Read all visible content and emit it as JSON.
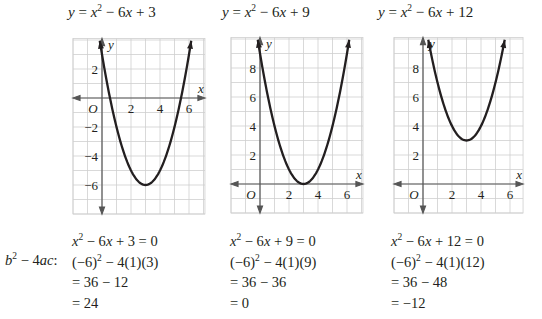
{
  "titles": [
    {
      "lhs": "y",
      "rhs_a": "x",
      "exp": "2",
      "rhs_b": " − 6",
      "var": "x",
      "rhs_c": " + 3"
    },
    {
      "lhs": "y",
      "rhs_a": "x",
      "exp": "2",
      "rhs_b": " − 6",
      "var": "x",
      "rhs_c": " + 9"
    },
    {
      "lhs": "y",
      "rhs_a": "x",
      "exp": "2",
      "rhs_b": " − 6",
      "var": "x",
      "rhs_c": " + 12"
    }
  ],
  "discriminant_label": {
    "b": "b",
    "exp": "2",
    "rest": " − 4",
    "ac": "ac",
    "colon": ":"
  },
  "calculations": [
    {
      "equation": {
        "x": "x",
        "exp": "2",
        "mid": " − 6",
        "x2": "x",
        "end": " + 3 = 0"
      },
      "substitution": {
        "base": "(−6)",
        "exp": "2",
        "end": " − 4(1)(3)"
      },
      "step": "= 36 − 12",
      "result": "= 24"
    },
    {
      "equation": {
        "x": "x",
        "exp": "2",
        "mid": " − 6",
        "x2": "x",
        "end": " + 9 = 0"
      },
      "substitution": {
        "base": "(−6)",
        "exp": "2",
        "end": " − 4(1)(9)"
      },
      "step": "= 36 − 36",
      "result": "= 0"
    },
    {
      "equation": {
        "x": "x",
        "exp": "2",
        "mid": " − 6",
        "x2": "x",
        "end": " + 12 = 0"
      },
      "substitution": {
        "base": "(−6)",
        "exp": "2",
        "end": " − 4(1)(12)"
      },
      "step": "= 36 − 48",
      "result": "= −12"
    }
  ],
  "axis_labels": {
    "x": "x",
    "y": "y",
    "origin": "O"
  },
  "colors": {
    "grid": "#cfcfcf",
    "axis": "#555555",
    "curve": "#231f20",
    "text": "#231f20"
  },
  "chart_data": [
    {
      "type": "line",
      "title": "y = x^2 − 6x + 3",
      "function": {
        "a": 1,
        "b": -6,
        "c": 3
      },
      "xlabel": "x",
      "ylabel": "y",
      "xlim": [
        -2,
        7.1
      ],
      "ylim": [
        -8,
        4.1
      ],
      "x_ticks": [
        2,
        4,
        6
      ],
      "y_ticks": [
        2,
        -2,
        -4,
        -6
      ],
      "grid": true,
      "grid_step": 1,
      "vertex": [
        3,
        -6
      ],
      "x_intercepts": [
        0.55,
        5.45
      ],
      "points": [
        [
          0,
          3
        ],
        [
          1,
          -2
        ],
        [
          2,
          -5
        ],
        [
          3,
          -6
        ],
        [
          4,
          -5
        ],
        [
          5,
          -2
        ],
        [
          6,
          3
        ]
      ]
    },
    {
      "type": "line",
      "title": "y = x^2 − 6x + 9",
      "function": {
        "a": 1,
        "b": -6,
        "c": 9
      },
      "xlabel": "x",
      "ylabel": "y",
      "xlim": [
        -2,
        7.1
      ],
      "ylim": [
        -2,
        10.1
      ],
      "x_ticks": [
        2,
        4,
        6
      ],
      "y_ticks": [
        2,
        4,
        6,
        8
      ],
      "grid": true,
      "grid_step": 1,
      "vertex": [
        3,
        0
      ],
      "x_intercepts": [
        3
      ],
      "points": [
        [
          0,
          9
        ],
        [
          1,
          4
        ],
        [
          2,
          1
        ],
        [
          3,
          0
        ],
        [
          4,
          1
        ],
        [
          5,
          4
        ],
        [
          6,
          9
        ]
      ]
    },
    {
      "type": "line",
      "title": "y = x^2 − 6x + 12",
      "function": {
        "a": 1,
        "b": -6,
        "c": 12
      },
      "xlabel": "x",
      "ylabel": "y",
      "xlim": [
        -2,
        6.9
      ],
      "ylim": [
        -2,
        10.1
      ],
      "x_ticks": [
        2,
        4,
        6
      ],
      "y_ticks": [
        2,
        4,
        6,
        8
      ],
      "grid": true,
      "grid_step": 1,
      "vertex": [
        3,
        3
      ],
      "x_intercepts": [],
      "points": [
        [
          1,
          7
        ],
        [
          2,
          4
        ],
        [
          3,
          3
        ],
        [
          4,
          4
        ],
        [
          5,
          7
        ]
      ]
    }
  ]
}
